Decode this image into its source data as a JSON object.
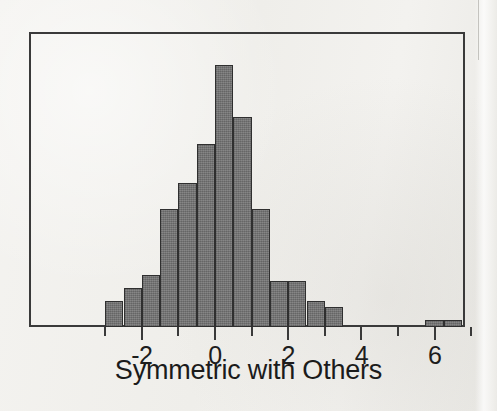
{
  "figure": {
    "kind": "histogram-figure",
    "background_color": "#f2f1ee",
    "frame_color": "#3a3a3a",
    "bar_fill_color": "#7b7b7b",
    "bar_edge_color": "#2f2f2f"
  },
  "chart_data": {
    "type": "bar",
    "subtype": "histogram",
    "title": "",
    "subtitle": "",
    "xlabel": "Symmetric with Others",
    "ylabel": "",
    "grid": false,
    "legend": null,
    "xlim": [
      -3.6,
      8.3
    ],
    "ylim": [
      0,
      41
    ],
    "bin_width": 0.5,
    "xtick_labels": [
      "-2",
      "0",
      "2",
      "4",
      "6"
    ],
    "xtick_values": [
      -2,
      0,
      2,
      4,
      6
    ],
    "xtick_minor_values": [
      -3,
      -1,
      1,
      3,
      5,
      7
    ],
    "ytick_labels": [],
    "bin_edges": [
      -3.0,
      -2.5,
      -2.0,
      -1.5,
      -1.0,
      -0.5,
      0.0,
      0.5,
      1.0,
      1.5,
      2.0,
      2.5,
      3.0,
      3.5
    ],
    "categories": [
      "-3.0 to -2.5",
      "-2.5 to -2.0",
      "-2.0 to -1.5",
      "-1.5 to -1.0",
      "-1.0 to -0.5",
      "-0.5 to 0.0",
      "0.0 to 0.5",
      "0.5 to 1.0",
      "1.0 to 1.5",
      "1.5 to 2.0",
      "2.0 to 2.5",
      "2.5 to 3.0",
      "3.0 to 3.5",
      "5.75 to 6.25",
      "6.25 to 6.75"
    ],
    "values": [
      4,
      6,
      8,
      18,
      22,
      28,
      40,
      32,
      18,
      7,
      7,
      4,
      3,
      1,
      1
    ],
    "annotations": [
      "Two small isolated bars near 6 (outliers)"
    ]
  },
  "bars": [
    {
      "name": "bar-bin--3.0",
      "x0": -3.0,
      "x1": -2.5,
      "count": 4
    },
    {
      "name": "bar-bin--2.5",
      "x0": -2.5,
      "x1": -2.0,
      "count": 6
    },
    {
      "name": "bar-bin--2.0",
      "x0": -2.0,
      "x1": -1.5,
      "count": 8
    },
    {
      "name": "bar-bin--1.5",
      "x0": -1.5,
      "x1": -1.0,
      "count": 18
    },
    {
      "name": "bar-bin--1.0",
      "x0": -1.0,
      "x1": -0.5,
      "count": 22
    },
    {
      "name": "bar-bin--0.5",
      "x0": -0.5,
      "x1": 0.0,
      "count": 28
    },
    {
      "name": "bar-bin-0.0",
      "x0": 0.0,
      "x1": 0.5,
      "count": 40
    },
    {
      "name": "bar-bin-0.5",
      "x0": 0.5,
      "x1": 1.0,
      "count": 32
    },
    {
      "name": "bar-bin-1.0",
      "x0": 1.0,
      "x1": 1.5,
      "count": 18
    },
    {
      "name": "bar-bin-1.5",
      "x0": 1.5,
      "x1": 2.0,
      "count": 7
    },
    {
      "name": "bar-bin-2.0",
      "x0": 2.0,
      "x1": 2.5,
      "count": 7
    },
    {
      "name": "bar-bin-2.5",
      "x0": 2.5,
      "x1": 3.0,
      "count": 4
    },
    {
      "name": "bar-bin-3.0",
      "x0": 3.0,
      "x1": 3.5,
      "count": 3
    },
    {
      "name": "bar-bin-5.75",
      "x0": 5.75,
      "x1": 6.25,
      "count": 1
    },
    {
      "name": "bar-bin-6.25",
      "x0": 6.25,
      "x1": 6.75,
      "count": 1
    }
  ],
  "axis": {
    "xlabel_text": "Symmetric with Others",
    "ticks": [
      {
        "value": -3,
        "label": "",
        "major": false
      },
      {
        "value": -2,
        "label": "-2",
        "major": true
      },
      {
        "value": -1,
        "label": "",
        "major": false
      },
      {
        "value": 0,
        "label": "0",
        "major": true
      },
      {
        "value": 1,
        "label": "",
        "major": false
      },
      {
        "value": 2,
        "label": "2",
        "major": true
      },
      {
        "value": 3,
        "label": "",
        "major": false
      },
      {
        "value": 4,
        "label": "4",
        "major": true
      },
      {
        "value": 5,
        "label": "",
        "major": false
      },
      {
        "value": 6,
        "label": "6",
        "major": true
      },
      {
        "value": 7,
        "label": "",
        "major": false
      }
    ]
  },
  "geometry": {
    "plot_left_px": 29,
    "plot_right_px": 465,
    "plot_top_px": 32,
    "plot_bottom_px": 327,
    "x_origin_px": 215,
    "px_per_unit": 36.6,
    "px_per_count": 6.55
  }
}
